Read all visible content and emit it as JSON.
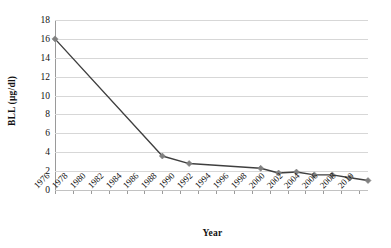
{
  "chart_data": {
    "type": "line",
    "title": "",
    "xlabel": "Year",
    "ylabel": "BLL (µg/dl)",
    "xlim": [
      1976,
      2011
    ],
    "ylim": [
      0,
      18
    ],
    "ytick_step": 2,
    "xtick_step": 2,
    "grid": "horizontal",
    "legend": "none",
    "marker": "diamond",
    "marker_color": "#808080",
    "line_color": "#3f3f3f",
    "ytick_labels": [
      "0",
      "2",
      "4",
      "6",
      "8",
      "10",
      "12",
      "14",
      "16",
      "18"
    ],
    "xtick_labels": [
      "1976",
      "1978",
      "1980",
      "1982",
      "1984",
      "1986",
      "1988",
      "1990",
      "1992",
      "1994",
      "1996",
      "1998",
      "2000",
      "2002",
      "2004",
      "2006",
      "2008",
      "2010"
    ],
    "series": [
      {
        "name": "BLL",
        "x": [
          1976,
          1988,
          1991,
          1999,
          2001,
          2003,
          2005,
          2007,
          2009,
          2011
        ],
        "values": [
          16.0,
          3.6,
          2.8,
          2.3,
          1.8,
          1.9,
          1.6,
          1.6,
          1.3,
          1.0
        ]
      }
    ]
  }
}
